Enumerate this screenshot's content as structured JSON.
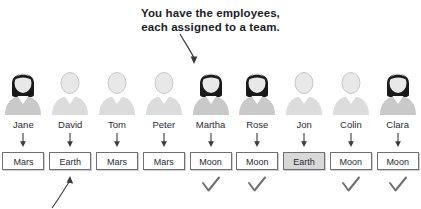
{
  "title": {
    "line1": "You have the employees,",
    "line2": "each assigned to a team."
  },
  "icons": {
    "title_arrow": "curved-arrow-down-right-icon",
    "bottom_arrow": "callout-arrow-up-right-icon",
    "connector_arrow": "arrow-down-icon",
    "check": "check-mark-icon",
    "person_female": "person-female-icon",
    "person_male": "person-male-icon"
  },
  "colors": {
    "text": "#2b2b33",
    "title_text": "#1d1d2b",
    "box_border": "#6f6f77",
    "box_fill": "#ffffff",
    "box_fill_highlight": "#d8d8d8",
    "check": "#6e6e76",
    "arrow": "#3a3a44",
    "body_gray": "#c9c9c9",
    "body_gray_light": "#dcdcdc",
    "hair_dark": "#1a1a1a",
    "face_light": "#e8e8e8"
  },
  "employees": [
    {
      "name": "Jane",
      "team": "Mars",
      "checked": false,
      "highlighted": false,
      "figure": "female"
    },
    {
      "name": "David",
      "team": "Earth",
      "checked": false,
      "highlighted": false,
      "figure": "male"
    },
    {
      "name": "Tom",
      "team": "Mars",
      "checked": false,
      "highlighted": false,
      "figure": "male"
    },
    {
      "name": "Peter",
      "team": "Mars",
      "checked": false,
      "highlighted": false,
      "figure": "male"
    },
    {
      "name": "Martha",
      "team": "Moon",
      "checked": true,
      "highlighted": false,
      "figure": "female"
    },
    {
      "name": "Rose",
      "team": "Moon",
      "checked": true,
      "highlighted": false,
      "figure": "female"
    },
    {
      "name": "Jon",
      "team": "Earth",
      "checked": false,
      "highlighted": true,
      "figure": "male"
    },
    {
      "name": "Colin",
      "team": "Moon",
      "checked": true,
      "highlighted": false,
      "figure": "male"
    },
    {
      "name": "Clara",
      "team": "Moon",
      "checked": true,
      "highlighted": false,
      "figure": "female"
    }
  ]
}
